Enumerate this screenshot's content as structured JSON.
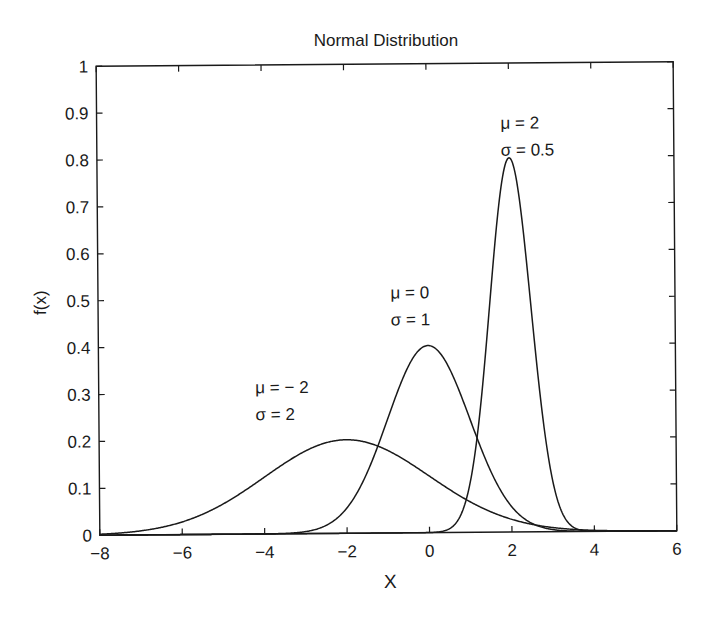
{
  "chart_data": {
    "type": "line",
    "title": "Normal Distribution",
    "xlabel": "X",
    "ylabel": "f(x)",
    "xlim": [
      -8,
      6
    ],
    "ylim": [
      0,
      1
    ],
    "xticks": [
      -8,
      -6,
      -4,
      -2,
      0,
      2,
      4,
      6
    ],
    "xtick_labels": [
      "−8",
      "−6",
      "−4",
      "−2",
      "0",
      "2",
      "4",
      "6"
    ],
    "yticks": [
      0,
      0.1,
      0.2,
      0.3,
      0.4,
      0.5,
      0.6,
      0.7,
      0.8,
      0.9,
      1
    ],
    "ytick_labels": [
      "0",
      "0.1",
      "0.2",
      "0.3",
      "0.4",
      "0.5",
      "0.6",
      "0.7",
      "0.8",
      "0.9",
      "1"
    ],
    "grid": false,
    "legend": "none (inline annotations)",
    "line_color": "#1a1a1a",
    "series": [
      {
        "name": "mu=-2, sigma=2",
        "mu": -2,
        "sigma": 2,
        "peak": 0.1995,
        "annotation": [
          "μ = − 2",
          "σ = 2"
        ],
        "label_pos": [
          -4.2,
          0.3
        ]
      },
      {
        "name": "mu=0, sigma=1",
        "mu": 0,
        "sigma": 1,
        "peak": 0.3989,
        "annotation": [
          "μ = 0",
          "σ = 1"
        ],
        "label_pos": [
          -0.9,
          0.5
        ]
      },
      {
        "name": "mu=2, sigma=0.5",
        "mu": 2,
        "sigma": 0.5,
        "peak": 0.7979,
        "annotation": [
          "μ = 2",
          "σ = 0.5"
        ],
        "label_pos": [
          1.8,
          0.86
        ]
      }
    ]
  }
}
